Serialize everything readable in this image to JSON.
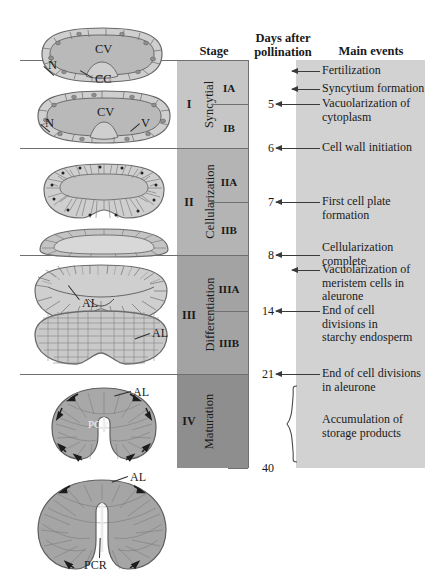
{
  "headers": {
    "stage": "Stage",
    "days": "Days after\npollination",
    "days_line1": "Days after",
    "days_line2": "pollination",
    "events": "Main events"
  },
  "stages": [
    {
      "roman": "I",
      "name": "Syncytial",
      "sub_a": "IA",
      "sub_b": "IB",
      "color": "#c6c6c6"
    },
    {
      "roman": "II",
      "name": "Cellularization",
      "sub_a": "IIA",
      "sub_b": "IIB",
      "color": "#b4b4b4"
    },
    {
      "roman": "III",
      "name": "Differentiation",
      "sub_a": "IIIA",
      "sub_b": "IIIB",
      "color": "#a3a3a3"
    },
    {
      "roman": "IV",
      "name": "Maturation",
      "sub_a": "",
      "sub_b": "",
      "color": "#8e8e8e"
    }
  ],
  "day_marks": [
    "5",
    "6",
    "7",
    "8",
    "14",
    "21",
    "40"
  ],
  "events": [
    {
      "label": "Fertilization",
      "day": ""
    },
    {
      "label": "Syncytium formation",
      "day": ""
    },
    {
      "label": "Vacuolarization of\ncytoplasm",
      "day": "5"
    },
    {
      "label": "Cell wall initiation",
      "day": "6"
    },
    {
      "label": "First cell plate\nformation",
      "day": "7"
    },
    {
      "label": "Cellularization\ncomplete",
      "day": "8"
    },
    {
      "label": "Vacuolarization of\nmeristem cells in\naleurone",
      "day": ""
    },
    {
      "label": "End of cell\ndivisions in\nstarchy endosperm",
      "day": "14"
    },
    {
      "label": "End of cell divisions\nin aleurone",
      "day": "21"
    }
  ],
  "event_lines": {
    "fertilization": [
      "Fertilization"
    ],
    "syncytium": [
      "Syncytium formation"
    ],
    "vacuolarization_cytoplasm": [
      "Vacuolarization of",
      "cytoplasm"
    ],
    "cell_wall_initiation": [
      "Cell wall initiation"
    ],
    "first_cell_plate": [
      "First cell plate",
      "formation"
    ],
    "cellularization_complete": [
      "Cellularization",
      "complete"
    ],
    "vacuolarization_meristem": [
      "Vacuolarization of",
      "meristem cells in",
      "aleurone"
    ],
    "end_divisions_starchy": [
      "End of cell",
      "divisions in",
      "starchy endosperm"
    ],
    "end_divisions_aleurone": [
      "End of cell divisions",
      "in aleurone"
    ],
    "accumulation": [
      "Accumulation of",
      "storage products"
    ]
  },
  "brace_event": {
    "line1": "Accumulation of",
    "line2": "storage products",
    "start_day": "21",
    "end_day": "40"
  },
  "diagram_labels": {
    "cv": "CV",
    "n": "N",
    "cc": "CC",
    "v": "V",
    "al": "AL",
    "pcr": "PCR"
  },
  "illustrations": [
    {
      "name": "syncytial-early",
      "labels": [
        "CV",
        "N",
        "CC"
      ]
    },
    {
      "name": "syncytial-late",
      "labels": [
        "CV",
        "N",
        "V"
      ]
    },
    {
      "name": "cellularization-a",
      "labels": []
    },
    {
      "name": "cellularization-b",
      "labels": []
    },
    {
      "name": "differentiation-a",
      "labels": [
        "AL"
      ]
    },
    {
      "name": "differentiation-b",
      "labels": [
        "AL"
      ]
    },
    {
      "name": "maturation-a",
      "labels": [
        "AL",
        "PCR"
      ]
    },
    {
      "name": "maturation-b",
      "labels": [
        "AL",
        "PCR"
      ]
    }
  ],
  "colors": {
    "events_panel": "#d2d2d2",
    "rule": "#6f6f6f",
    "arrow": "#3a3a3a",
    "tissue_fill": "#b9b9b9",
    "tissue_light": "#d8d8d8",
    "tissue_stroke": "#6a6a6a"
  }
}
